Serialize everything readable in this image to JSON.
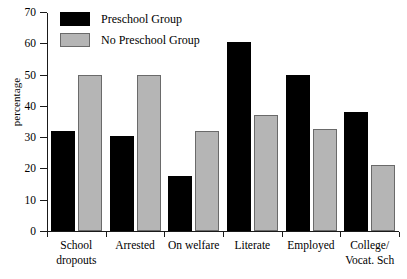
{
  "chart_data": {
    "type": "bar",
    "title": "",
    "xlabel": "",
    "ylabel": "percentage",
    "ylim": [
      0,
      70
    ],
    "yticks": [
      0,
      10,
      20,
      30,
      40,
      50,
      60,
      70
    ],
    "grid": false,
    "legend_position": "top-left",
    "categories": [
      "School dropouts",
      "Arrested",
      "On welfare",
      "Literate",
      "Employed",
      "College/ Vocat. Sch"
    ],
    "category_lines": [
      [
        "School",
        "dropouts"
      ],
      [
        "Arrested",
        ""
      ],
      [
        "On welfare",
        ""
      ],
      [
        "Literate",
        ""
      ],
      [
        "Employed",
        ""
      ],
      [
        "College/",
        "Vocat. Sch"
      ]
    ],
    "series": [
      {
        "name": "Preschool Group",
        "color": "#000000",
        "values": [
          32,
          30.5,
          17.5,
          60.5,
          50,
          38
        ]
      },
      {
        "name": "No Preschool Group",
        "color": "#b5b5b5",
        "values": [
          50,
          50,
          32,
          37,
          32.5,
          21
        ]
      }
    ]
  }
}
